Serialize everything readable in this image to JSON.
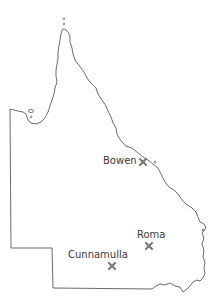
{
  "map": {
    "region": "Queensland",
    "outline_color": "#444444",
    "marker_color": "#7a7a7a",
    "label_color": "#3a3a3a",
    "places": [
      {
        "name": "Bowen",
        "marker_x": 143,
        "marker_y": 162,
        "label_x": 103,
        "label_y": 155
      },
      {
        "name": "Roma",
        "marker_x": 149,
        "marker_y": 246,
        "label_x": 137,
        "label_y": 230
      },
      {
        "name": "Cunnamulla",
        "marker_x": 112,
        "marker_y": 266,
        "label_x": 68,
        "label_y": 250
      }
    ]
  }
}
